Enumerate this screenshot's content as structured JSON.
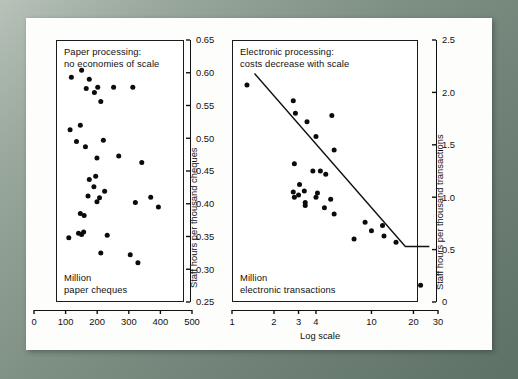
{
  "figure": {
    "background_color": "#fdfdfb",
    "frame_color": "#7e8f83",
    "marker_color": "#0b0b0b",
    "axis_color": "#111111"
  },
  "chart_data": [
    {
      "type": "scatter",
      "id": "paper-processing",
      "title": "Paper processing:\nno economies of scale",
      "title_line1": "Paper processing:",
      "title_line2": "no economies of scale",
      "xlabel": "Million\npaper cheques",
      "xlabel_line1": "Million",
      "xlabel_line2": "paper cheques",
      "ylabel": "Staff hours per thousand cheques",
      "xlim": [
        0,
        500
      ],
      "ylim": [
        0.25,
        0.65
      ],
      "xticks": [
        0,
        100,
        200,
        300,
        400,
        500
      ],
      "xticklabels": [
        "0",
        "100",
        "200",
        "300",
        "400",
        "500"
      ],
      "yticks": [
        0.25,
        0.3,
        0.35,
        0.4,
        0.45,
        0.5,
        0.55,
        0.6,
        0.65
      ],
      "yticklabels": [
        "0.25",
        "0.30",
        "0.35",
        "0.40",
        "0.45",
        "0.50",
        "0.55",
        "0.60",
        "0.65"
      ],
      "xscale": "linear",
      "yscale": "linear",
      "grid": false,
      "legend": null,
      "trendline": null,
      "points": [
        [
          60,
          0.593
        ],
        [
          100,
          0.604
        ],
        [
          130,
          0.59
        ],
        [
          118,
          0.576
        ],
        [
          163,
          0.578
        ],
        [
          150,
          0.57
        ],
        [
          225,
          0.578
        ],
        [
          300,
          0.578
        ],
        [
          175,
          0.556
        ],
        [
          55,
          0.513
        ],
        [
          95,
          0.52
        ],
        [
          80,
          0.495
        ],
        [
          115,
          0.487
        ],
        [
          185,
          0.497
        ],
        [
          160,
          0.47
        ],
        [
          245,
          0.473
        ],
        [
          335,
          0.463
        ],
        [
          130,
          0.437
        ],
        [
          155,
          0.442
        ],
        [
          148,
          0.426
        ],
        [
          190,
          0.419
        ],
        [
          125,
          0.412
        ],
        [
          170,
          0.409
        ],
        [
          160,
          0.403
        ],
        [
          310,
          0.402
        ],
        [
          370,
          0.41
        ],
        [
          400,
          0.395
        ],
        [
          95,
          0.385
        ],
        [
          110,
          0.382
        ],
        [
          88,
          0.355
        ],
        [
          100,
          0.353
        ],
        [
          108,
          0.357
        ],
        [
          50,
          0.348
        ],
        [
          200,
          0.352
        ],
        [
          175,
          0.325
        ],
        [
          290,
          0.322
        ],
        [
          320,
          0.31
        ]
      ]
    },
    {
      "type": "scatter",
      "id": "electronic-processing",
      "title": "Electronic processing:\ncosts decrease with scale",
      "title_line1": "Electronic processing:",
      "title_line2": "costs decrease with scale",
      "xlabel": "Million\nelectronic transactions",
      "xlabel_line1": "Million",
      "xlabel_line2": "electronic transactions",
      "xlabel_axis": "Log scale",
      "ylabel": "Staff hours per thousand transactions",
      "xlim": [
        1,
        30
      ],
      "ylim": [
        0,
        2.5
      ],
      "xscale": "log",
      "yscale": "linear",
      "xticks": [
        1,
        2,
        3,
        4,
        10,
        20,
        30
      ],
      "xticklabels": [
        "1",
        "2",
        "3",
        "4",
        "10",
        "20",
        "30"
      ],
      "yticks": [
        0,
        0.5,
        1.0,
        1.5,
        2.0,
        2.5
      ],
      "yticklabels": [
        "0",
        "0.5",
        "1.0",
        "1.5",
        "2.0",
        "2.5"
      ],
      "grid": false,
      "legend": null,
      "trendline": {
        "x1": 1.45,
        "y1": 2.18,
        "x2": 17.5,
        "y2": 0.53,
        "flat_to_x": 26.0
      },
      "points": [
        [
          1.28,
          2.07
        ],
        [
          2.75,
          1.92
        ],
        [
          2.85,
          1.8
        ],
        [
          3.45,
          1.72
        ],
        [
          5.2,
          1.78
        ],
        [
          4.0,
          1.58
        ],
        [
          5.4,
          1.45
        ],
        [
          2.8,
          1.32
        ],
        [
          3.8,
          1.25
        ],
        [
          4.3,
          1.25
        ],
        [
          4.7,
          1.22
        ],
        [
          3.05,
          1.12
        ],
        [
          2.75,
          1.05
        ],
        [
          3.3,
          1.06
        ],
        [
          4.1,
          1.04
        ],
        [
          5.1,
          0.98
        ],
        [
          3.35,
          0.92
        ],
        [
          2.8,
          1.0
        ],
        [
          3.0,
          1.02
        ],
        [
          3.35,
          0.95
        ],
        [
          4.0,
          1.0
        ],
        [
          4.6,
          0.9
        ],
        [
          5.4,
          0.84
        ],
        [
          9.0,
          0.76
        ],
        [
          10.0,
          0.68
        ],
        [
          12.0,
          0.73
        ],
        [
          12.3,
          0.63
        ],
        [
          7.5,
          0.6
        ],
        [
          15.0,
          0.57
        ],
        [
          22.5,
          0.16
        ]
      ]
    }
  ]
}
